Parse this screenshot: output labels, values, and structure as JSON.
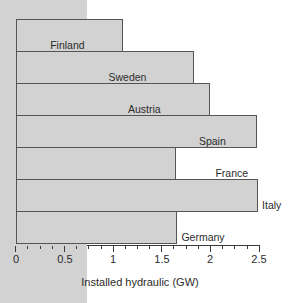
{
  "chart_data": {
    "type": "bar",
    "orientation": "horizontal",
    "title": "",
    "subtitle": "",
    "xlabel": "Installed hydraulic (GW)",
    "ylabel": "",
    "categories": [
      "Finland",
      "Sweden",
      "Austria",
      "Spain",
      "France",
      "Italy",
      "Germany"
    ],
    "values": [
      0.3,
      0.9,
      1.1,
      1.83,
      2.0,
      2.48,
      1.65
    ],
    "series": [
      {
        "name": "Installed hydraulic (GW)",
        "values": [
          0.3,
          0.9,
          1.1,
          1.83,
          2.0,
          2.48,
          1.65
        ]
      }
    ],
    "xlim": [
      0,
      2.5
    ],
    "x_major_ticks": [
      0,
      0.5,
      1,
      1.5,
      2,
      2.5
    ],
    "x_tick_labels": [
      "0",
      "0.5",
      "1",
      "1.5",
      "2",
      "2.5"
    ],
    "x_minor_tick_step": 0.125,
    "grid": false,
    "legend": null,
    "legend_position": "none",
    "bar_fill_color": "#d2d2d2",
    "bar_edge_color": "#555555",
    "axis_color": "#3a3a3a",
    "label_placement": "right-of-bar-end"
  }
}
